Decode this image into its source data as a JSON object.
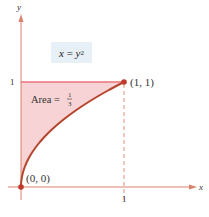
{
  "chart_data": {
    "type": "area",
    "title": "",
    "equation_label": "x = y^2",
    "equation": {
      "lhs": "x",
      "eq": "=",
      "rhs_base": "y",
      "rhs_exp": "2"
    },
    "xlabel": "x",
    "ylabel": "y",
    "xlim": [
      0,
      1
    ],
    "ylim": [
      0,
      1
    ],
    "x_ticks": [
      "1"
    ],
    "y_ticks": [
      "1"
    ],
    "curve": {
      "name": "x = y^2",
      "points": [
        [
          0,
          0
        ],
        [
          0.01,
          0.1
        ],
        [
          0.04,
          0.2
        ],
        [
          0.09,
          0.3
        ],
        [
          0.16,
          0.4
        ],
        [
          0.25,
          0.5
        ],
        [
          0.36,
          0.6
        ],
        [
          0.49,
          0.7
        ],
        [
          0.64,
          0.8
        ],
        [
          0.81,
          0.9
        ],
        [
          1,
          1
        ]
      ]
    },
    "shaded_region": "between y-axis, y = 1 and curve x = y^2",
    "annotations": {
      "area_label": "Area = ",
      "area_num": "1",
      "area_den": "3",
      "point_origin": "(0, 0)",
      "point_end": "(1, 1)"
    },
    "grid": false,
    "colors": {
      "curve": "#b5462e",
      "fill": "#f7d3d5",
      "line_y1": "#e8737a",
      "axis": "#d9826c",
      "point": "#c0392b",
      "label_box": "#e8f0f7"
    }
  }
}
